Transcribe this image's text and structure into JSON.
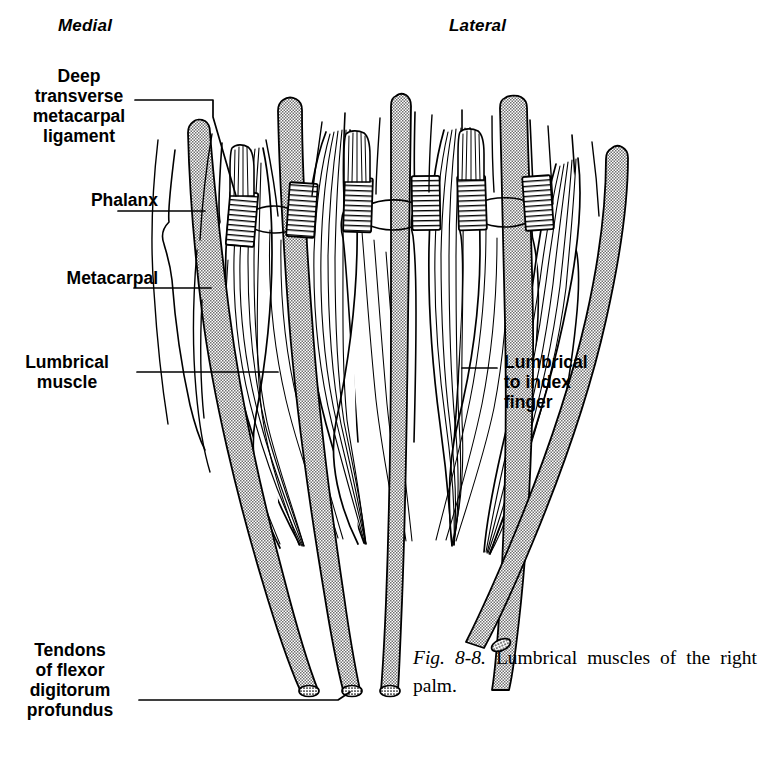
{
  "figure": {
    "orientation": {
      "medial": "Medial",
      "lateral": "Lateral"
    },
    "labels": {
      "deep_transverse_metacarpal_ligament": "Deep\ntransverse\nmetacarpal\nligament",
      "phalanx": "Phalanx",
      "metacarpal": "Metacarpal",
      "lumbrical_muscle": "Lumbrical\nmuscle",
      "lumbrical_to_index_finger": "Lumbrical\nto index\nfinger",
      "tendons_of_flexor_digitorum_profundus": "Tendons\nof flexor\ndigitorum\nprofundus"
    },
    "caption": {
      "figure_number": "Fig. 8-8.",
      "text": " Lumbrical muscles of the right palm."
    },
    "colors": {
      "ink": "#000000",
      "background": "#ffffff",
      "stipple_fill": "#8f8f8f",
      "hatch_fill": "#ffffff"
    },
    "structures": {
      "digit_count": 4,
      "tendon_bundle_count": 4,
      "ligament_band_count": 6,
      "lumbrical_muscle_count": 4
    }
  }
}
